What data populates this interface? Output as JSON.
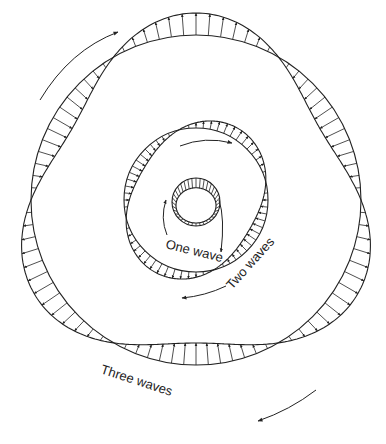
{
  "diagram": {
    "type": "mode-shape diagram (circumferential waves)",
    "stroke_color": "#222222",
    "background": "#ffffff",
    "center": [
      196,
      200
    ],
    "modes": [
      {
        "name": "one",
        "label": "One wave",
        "base_radius": 20,
        "amplitude": 6,
        "waves": 1
      },
      {
        "name": "two",
        "label": "Two waves",
        "base_radius": 72,
        "amplitude": 11,
        "waves": 2
      },
      {
        "name": "three",
        "label": "Three waves",
        "base_radius": 165,
        "amplitude": 22,
        "waves": 3
      }
    ],
    "rotation_arrows": [
      {
        "mode": "one",
        "count": 2,
        "direction": "clockwise"
      },
      {
        "mode": "two",
        "count": 2,
        "direction": "clockwise"
      },
      {
        "mode": "three",
        "count": 2,
        "direction": "clockwise"
      }
    ]
  }
}
